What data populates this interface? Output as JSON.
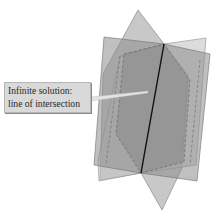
{
  "figure": {
    "callout": {
      "line1": "Infinite solution:",
      "line2": "line of intersection"
    },
    "colors": {
      "plane_light": "#bdbdbd",
      "plane_mid": "#9a9a9a",
      "plane_dark": "#858585",
      "intersection_line": "#111111",
      "callout_bg": "#d9d9d9"
    }
  }
}
